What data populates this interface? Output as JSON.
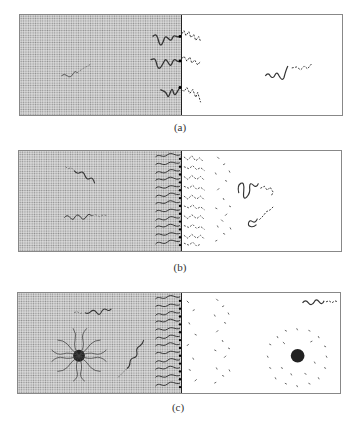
{
  "figure": {
    "panels": [
      {
        "id": "a",
        "label": "(a)",
        "description": "Few block copolymer chains at interface and in each phase"
      },
      {
        "id": "b",
        "label": "(b)",
        "description": "Saturated interface brush with free chains in bulk"
      },
      {
        "id": "c",
        "label": "(c)",
        "description": "Saturated interface plus micelles formed in both phases"
      }
    ],
    "legend": {
      "left_phase": "dotted shaded phase",
      "right_phase": "clear phase",
      "solid_chain": "block soluble in left phase",
      "dashed_chain": "block soluble in right phase"
    },
    "colors": {
      "shading": "#d8d8d8",
      "dots": "#8a8a8a",
      "chain": "#333333",
      "border": "#888888"
    }
  }
}
